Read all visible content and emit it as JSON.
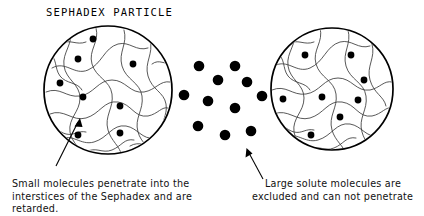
{
  "figure": {
    "title": "SEPHADEX PARTICLE",
    "background_color": "#ffffff",
    "ink_color": "#000000",
    "mesh_color": "#3a3a3a"
  },
  "captions": {
    "left": {
      "lines": [
        "Small molecules penetrate into the",
        "interstices of the Sephadex and are",
        "retarded."
      ]
    },
    "right": {
      "lines": [
        "Large solute molecules are",
        "excluded and can not penetrate"
      ]
    }
  },
  "particles": {
    "left_circle": {
      "label": "sephadex-particle-left",
      "cx": 108,
      "cy": 90,
      "r": 64,
      "small_molecule_radius": 3.4,
      "small_molecules": [
        {
          "x": 93,
          "y": 39
        },
        {
          "x": 78,
          "y": 59
        },
        {
          "x": 133,
          "y": 64
        },
        {
          "x": 60,
          "y": 83
        },
        {
          "x": 83,
          "y": 97
        },
        {
          "x": 120,
          "y": 106
        },
        {
          "x": 78,
          "y": 135
        },
        {
          "x": 120,
          "y": 133
        }
      ]
    },
    "right_circle": {
      "label": "sephadex-particle-right",
      "cx": 332,
      "cy": 89,
      "r": 61,
      "small_molecule_radius": 3.4,
      "small_molecules": [
        {
          "x": 305,
          "y": 55
        },
        {
          "x": 351,
          "y": 55
        },
        {
          "x": 364,
          "y": 80
        },
        {
          "x": 283,
          "y": 99
        },
        {
          "x": 322,
          "y": 97
        },
        {
          "x": 358,
          "y": 100
        },
        {
          "x": 340,
          "y": 117
        },
        {
          "x": 311,
          "y": 135
        }
      ]
    },
    "excluded_cluster": {
      "label": "large-solute-molecules",
      "large_molecule_radius": 5.3,
      "large_molecules": [
        {
          "x": 199,
          "y": 66
        },
        {
          "x": 235,
          "y": 66
        },
        {
          "x": 218,
          "y": 80
        },
        {
          "x": 247,
          "y": 82
        },
        {
          "x": 184,
          "y": 95
        },
        {
          "x": 208,
          "y": 101
        },
        {
          "x": 235,
          "y": 108
        },
        {
          "x": 198,
          "y": 126
        },
        {
          "x": 225,
          "y": 135
        },
        {
          "x": 251,
          "y": 131
        },
        {
          "x": 262,
          "y": 96
        }
      ]
    }
  },
  "leaders": {
    "left": {
      "from_x": 56,
      "from_y": 166,
      "to_x": 80,
      "to_y": 119
    },
    "right": {
      "from_x": 263,
      "from_y": 179,
      "to_x": 247,
      "to_y": 150
    }
  },
  "text_positions": {
    "title": {
      "x": 46,
      "y": 16
    },
    "left_caption": {
      "x": 12,
      "y": 187,
      "line_height": 12.5
    },
    "right_caption_line1": {
      "x": 265,
      "y": 187
    },
    "right_caption_line2": {
      "x": 252,
      "y": 199.5
    }
  }
}
